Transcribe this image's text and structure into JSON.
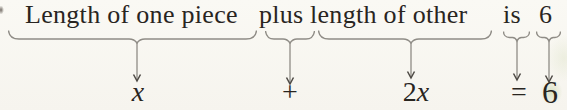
{
  "figure_text": "Length of one piece plus length of other is 6",
  "groups": [
    {
      "phrase": "Length of one piece",
      "symbol": "x"
    },
    {
      "phrase": "plus",
      "symbol": "+"
    },
    {
      "phrase": "length of other",
      "symbol": "2x"
    },
    {
      "phrase": "is",
      "symbol": "="
    },
    {
      "phrase": "6",
      "symbol": "6"
    }
  ],
  "colors": {
    "ink": "#29251f",
    "brace": "#8f8c86",
    "arrowhead": "#4e4a45",
    "background": "#faf9f4",
    "stain_green": "#96b25f"
  }
}
